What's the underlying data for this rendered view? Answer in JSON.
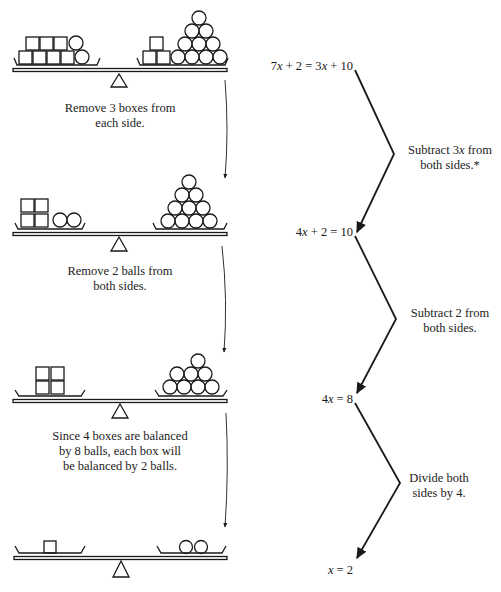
{
  "scales": [
    {
      "left": {
        "boxes_bottom": 4,
        "boxes_top": 3,
        "balls": 2
      },
      "right": {
        "boxes_bottom": 2,
        "boxes_top": 1,
        "balls": 10
      },
      "caption_lines": [
        "Remove 3 boxes from",
        "each side."
      ]
    },
    {
      "left": {
        "boxes": 4,
        "balls": 2
      },
      "right": {
        "balls": 10
      },
      "caption_lines": [
        "Remove 2 balls from",
        "both sides."
      ]
    },
    {
      "left": {
        "boxes": 4,
        "balls": 0
      },
      "right": {
        "balls": 8
      },
      "caption_lines": [
        "Since 4 boxes are balanced",
        "by 8 balls, each box will",
        "be balanced by 2 balls."
      ]
    },
    {
      "left": {
        "boxes": 1
      },
      "right": {
        "balls": 2
      },
      "caption_lines": []
    }
  ],
  "equations": [
    {
      "parts": [
        "7",
        "x",
        " + 2 = 3",
        "x",
        " + 10"
      ],
      "text": "7x + 2 = 3x + 10"
    },
    {
      "parts": [
        "4",
        "x",
        " + 2 = 10"
      ],
      "text": "4x + 2 = 10"
    },
    {
      "parts": [
        "4",
        "x",
        " = 8"
      ],
      "text": "4x = 8"
    },
    {
      "parts": [
        "",
        "x",
        " = 2"
      ],
      "text": "x = 2"
    }
  ],
  "steps": [
    {
      "line1_a": "Subtract 3",
      "line1_x": "x",
      "line1_b": " from",
      "line2": "both sides.*"
    },
    {
      "line1_a": "Subtract 2 from",
      "line1_x": "",
      "line1_b": "",
      "line2": "both sides."
    },
    {
      "line1_a": "Divide both",
      "line1_x": "",
      "line1_b": "",
      "line2": "sides by 4."
    }
  ],
  "colors": {
    "ink": "#1a1a1a",
    "paper": "#ffffff"
  }
}
